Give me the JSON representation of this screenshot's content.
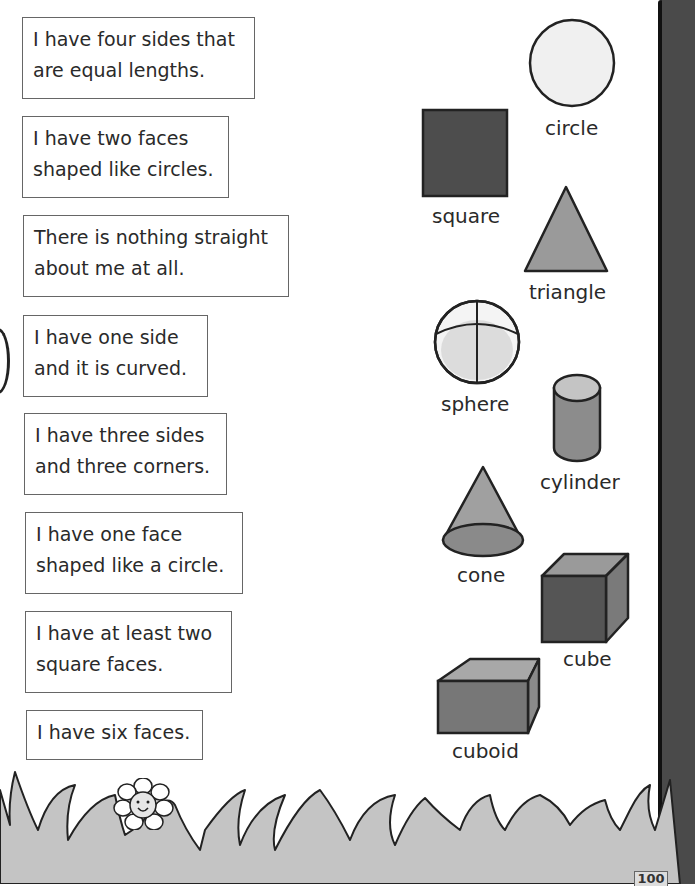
{
  "clues": [
    {
      "text": "I have four sides that\nare equal lengths."
    },
    {
      "text": "I have two faces\nshaped like circles."
    },
    {
      "text": "There is nothing straight\nabout me at all."
    },
    {
      "text": "I have one side\nand it is curved."
    },
    {
      "text": "I have three sides\nand three corners."
    },
    {
      "text": "I have one face\nshaped like a circle."
    },
    {
      "text": "I have at least two\nsquare faces."
    },
    {
      "text": "I have six faces."
    }
  ],
  "shapes": {
    "circle": {
      "label": "circle",
      "color": "#f0f0f0"
    },
    "square": {
      "label": "square",
      "color": "#4d4d4d"
    },
    "triangle": {
      "label": "triangle",
      "color": "#9a9a9a"
    },
    "sphere": {
      "label": "sphere",
      "color": "#e2e2e2"
    },
    "cylinder": {
      "label": "cylinder",
      "color": "#8c8c8c"
    },
    "cone": {
      "label": "cone",
      "color": "#9a9a9a"
    },
    "cube": {
      "label": "cube",
      "color": "#555555"
    },
    "cuboid": {
      "label": "cuboid",
      "color": "#777777"
    }
  },
  "footer": {
    "page_number": "100"
  }
}
